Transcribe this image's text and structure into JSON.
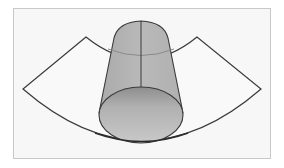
{
  "diagram": {
    "description": "Cylinder (truncated cone) standing inside an annular sector (fan-shaped ring)",
    "colors": {
      "background": "#ffffff",
      "frame_fill": "#f7f7f7",
      "frame_border": "#c8c8c8",
      "outline": "#3a3a3a",
      "cylinder_side": "#b4b4b4",
      "cylinder_side_light": "#c4c4c4",
      "base_top": "#8e8e8e",
      "base_bottom": "#c9c9c9",
      "hidden_arc": "#8a8a8a"
    },
    "shapes": [
      {
        "name": "annular-sector",
        "label": "ring sector"
      },
      {
        "name": "cylinder",
        "label": "cylinder"
      }
    ]
  }
}
